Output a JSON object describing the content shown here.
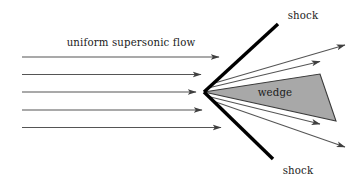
{
  "figure": {
    "domain": "diagram",
    "background_color": "#ffffff",
    "width": 352,
    "height": 181
  },
  "labels": {
    "flow": "uniform supersonic flow",
    "wedge": "wedge",
    "shock_upper": "shock",
    "shock_lower": "shock"
  },
  "colors": {
    "line": "#4a4a4a",
    "shock": "#000000",
    "wedge_fill": "#a8a8a8",
    "wedge_stroke": "#3a3a3a",
    "text": "#1a1a1a"
  },
  "geometry": {
    "apex": {
      "x": 204,
      "y": 92
    },
    "wedge_polygon": "204,92 320,74 336,121",
    "shock_upper": {
      "x1": 204,
      "y1": 92,
      "x2": 278,
      "y2": 24
    },
    "shock_lower": {
      "x1": 204,
      "y1": 92,
      "x2": 273,
      "y2": 159
    },
    "incoming_lines": [
      {
        "x1": 22,
        "y1": 57,
        "x2": 219,
        "y2": 57
      },
      {
        "x1": 22,
        "y1": 74.5,
        "x2": 201,
        "y2": 74.5
      },
      {
        "x1": 22,
        "y1": 92,
        "x2": 196,
        "y2": 92
      },
      {
        "x1": 22,
        "y1": 110,
        "x2": 202,
        "y2": 110
      },
      {
        "x1": 22,
        "y1": 127.5,
        "x2": 221,
        "y2": 127.5
      }
    ],
    "deflected_lines": [
      {
        "x1": 214,
        "y1": 84,
        "x2": 343,
        "y2": 46
      },
      {
        "x1": 208,
        "y1": 88,
        "x2": 318,
        "y2": 62
      },
      {
        "x1": 209,
        "y1": 97,
        "x2": 318,
        "y2": 124
      },
      {
        "x1": 214,
        "y1": 101,
        "x2": 343,
        "y2": 146
      }
    ],
    "label_positions": {
      "flow": {
        "x": 131,
        "y": 46
      },
      "wedge": {
        "x": 275,
        "y": 96
      },
      "shock_upper": {
        "x": 303,
        "y": 19
      },
      "shock_lower": {
        "x": 298,
        "y": 172
      }
    }
  }
}
